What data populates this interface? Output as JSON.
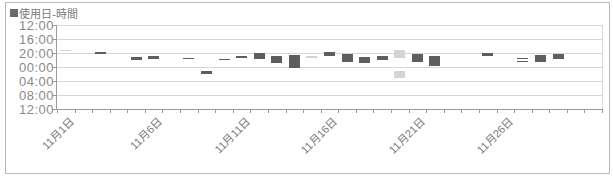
{
  "chart_data": {
    "type": "bar",
    "subtype": "floating-range (time of use per day)",
    "title": "",
    "legend": [
      {
        "label": "■使用日-時間",
        "color": "#5e5e5e"
      }
    ],
    "legend_position": "top-left",
    "xlabel": "",
    "ylabel": "",
    "y_tick_labels": [
      "12:00",
      "16:00",
      "20:00",
      "00:00",
      "04:00",
      "08:00",
      "12:00"
    ],
    "y_axis_reversed": true,
    "y_range": [
      "12:00",
      "12:00 (+1 day)"
    ],
    "x_tick_labels": [
      "11月1日",
      "11月6日",
      "11月11日",
      "11月16日",
      "11月21日",
      "11月26日"
    ],
    "x_categories": [
      "11月1日",
      "11月2日",
      "11月3日",
      "11月4日",
      "11月5日",
      "11月6日",
      "11月7日",
      "11月8日",
      "11月9日",
      "11月10日",
      "11月11日",
      "11月12日",
      "11月13日",
      "11月14日",
      "11月15日",
      "11月16日",
      "11月17日",
      "11月18日",
      "11月19日",
      "11月20日",
      "11月21日",
      "11月22日",
      "11月23日",
      "11月24日",
      "11月25日",
      "11月26日",
      "11月27日",
      "11月28日",
      "11月29日",
      "11月30日",
      "12月1日"
    ],
    "grid": true,
    "series": [
      {
        "name": "使用日-時間",
        "values": [
          {
            "day": "11月1日",
            "start": "19:00",
            "end": "19:15",
            "shade": "light"
          },
          {
            "day": "11月3日",
            "start": "19:45",
            "end": "20:15",
            "shade": "dark"
          },
          {
            "day": "11月5日",
            "start": "21:00",
            "end": "22:00",
            "shade": "dark"
          },
          {
            "day": "11月6日",
            "start": "20:45",
            "end": "21:40",
            "shade": "dark"
          },
          {
            "day": "11月8日",
            "start": "21:20",
            "end": "21:35",
            "shade": "dark"
          },
          {
            "day": "11月9日",
            "start": "01:15",
            "end": "02:00",
            "shade": "dark"
          },
          {
            "day": "11月10日",
            "start": "21:40",
            "end": "21:55",
            "shade": "dark"
          },
          {
            "day": "11月11日",
            "start": "20:55",
            "end": "21:10",
            "shade": "dark"
          },
          {
            "day": "11月12日",
            "start": "20:00",
            "end": "21:40",
            "shade": "dark"
          },
          {
            "day": "11月13日",
            "start": "20:50",
            "end": "22:50",
            "shade": "dark"
          },
          {
            "day": "11月14日",
            "start": "20:30",
            "end": "00:15",
            "shade": "dark"
          },
          {
            "day": "11月15日",
            "start": "20:55",
            "end": "21:10",
            "shade": "light"
          },
          {
            "day": "11月16日",
            "start": "19:40",
            "end": "20:50",
            "shade": "dark"
          },
          {
            "day": "11月17日",
            "start": "20:15",
            "end": "22:30",
            "shade": "dark"
          },
          {
            "day": "11月18日",
            "start": "21:10",
            "end": "22:50",
            "shade": "dark"
          },
          {
            "day": "11月19日",
            "start": "20:50",
            "end": "22:00",
            "shade": "dark"
          },
          {
            "day": "11月20日",
            "start": "19:15",
            "end": "21:20",
            "shade": "light"
          },
          {
            "day": "11月20日",
            "start": "01:15",
            "end": "03:00",
            "shade": "light"
          },
          {
            "day": "11月21日",
            "start": "20:15",
            "end": "22:30",
            "shade": "dark"
          },
          {
            "day": "11月22日",
            "start": "20:50",
            "end": "23:40",
            "shade": "dark"
          },
          {
            "day": "11月25日",
            "start": "20:00",
            "end": "20:50",
            "shade": "dark"
          },
          {
            "day": "11月27日",
            "start": "21:25",
            "end": "21:35",
            "shade": "dark"
          },
          {
            "day": "11月27日",
            "start": "22:10",
            "end": "22:20",
            "shade": "dark"
          },
          {
            "day": "11月28日",
            "start": "20:30",
            "end": "22:30",
            "shade": "dark"
          },
          {
            "day": "11月29日",
            "start": "20:15",
            "end": "21:40",
            "shade": "dark"
          }
        ]
      }
    ]
  },
  "legend": {
    "label": "使用日-時間"
  },
  "axis": {
    "y": [
      "12:00",
      "16:00",
      "20:00",
      "00:00",
      "04:00",
      "08:00",
      "12:00"
    ],
    "x": [
      "11月1日",
      "11月6日",
      "11月11日",
      "11月16日",
      "11月21日",
      "11月26日"
    ]
  },
  "colors": {
    "dark": "#5e5e5e",
    "light": "#d4d4d4",
    "grid": "#d6d6d6",
    "axis": "#9a9a9a"
  }
}
